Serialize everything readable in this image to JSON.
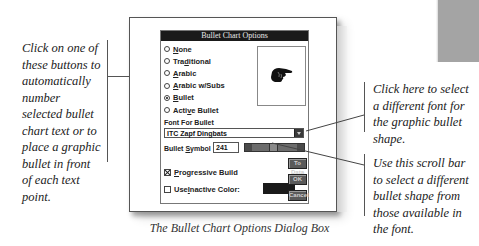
{
  "dialog": {
    "title": "Bullet Chart Options",
    "radio_options": [
      {
        "label": "None",
        "underline": "N",
        "rest": "one",
        "prefix": "",
        "selected": false
      },
      {
        "label": "Traditional",
        "prefix": "Tra",
        "underline": "d",
        "rest": "itional",
        "selected": false
      },
      {
        "label": "Arabic",
        "prefix": "",
        "underline": "A",
        "rest": "rabic",
        "selected": false
      },
      {
        "label": "Arabic w/Subs",
        "prefix": "",
        "underline": "A",
        "rest": "rabic w/Subs",
        "selected": false
      },
      {
        "label": "Bullet",
        "prefix": "",
        "underline": "B",
        "rest": "ullet",
        "selected": true
      },
      {
        "label": "Active Bullet",
        "prefix": "Acti",
        "underline": "v",
        "rest": "e Bullet",
        "selected": false
      }
    ],
    "preview_icon": "pointing-hand-bullet",
    "font_for_bullet_label": "Font For Bullet",
    "font_value": "ITC Zapf Dingbats",
    "bullet_symbol_label_prefix": "Bullet ",
    "bullet_symbol_label_ul": "S",
    "bullet_symbol_label_rest": "ymbol",
    "bullet_symbol_value": "241",
    "progressive_build": {
      "prefix": "",
      "underline": "P",
      "rest": "rogressive Build",
      "checked": true
    },
    "use_inactive_color": {
      "prefix": "Use ",
      "underline": "I",
      "rest": "nactive Color:",
      "checked": false
    },
    "inactive_color": "#1a1a1a",
    "buttons": {
      "to_data": "To Data",
      "ok": "OK",
      "cancel": "Cancel"
    }
  },
  "callouts": {
    "left": "Click on one of these buttons to automatically number selected bullet chart text or to place a graphic bullet in front of each text point.",
    "font": "Click here to select a different font for the graphic bullet shape.",
    "scroll": "Use this scroll bar to select a different bullet shape from those available in the font."
  },
  "caption": "The Bullet Chart Options Dialog Box"
}
